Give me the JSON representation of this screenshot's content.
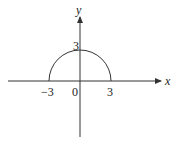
{
  "diagram": {
    "colors": {
      "stroke": "#333333",
      "text": "#222222",
      "background": "#ffffff"
    },
    "axes": {
      "x_label": "x",
      "y_label": "y"
    },
    "labels": {
      "origin": "0",
      "x_neg": "−3",
      "x_pos": "3",
      "y_top": "3"
    },
    "curve": {
      "type": "semicircle",
      "center": [
        0,
        0
      ],
      "radius": 3,
      "half": "upper"
    }
  }
}
